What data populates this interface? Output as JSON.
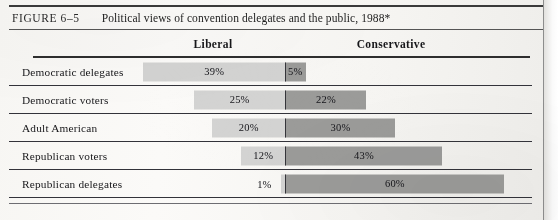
{
  "figure": {
    "label": "FIGURE 6–5",
    "title": "Political views of convention delegates and the public, 1988*"
  },
  "columns": {
    "left_header": "Liberal",
    "right_header": "Conservative"
  },
  "colors": {
    "liberal_bar": "#d3d3d2",
    "conservative_bar": "#9b9b99",
    "rule": "#33333a",
    "text": "#17171a",
    "page_background": "#f7f6f3"
  },
  "chart_data": {
    "type": "bar",
    "orientation": "horizontal-diverging",
    "title": "Political views of convention delegates and the public, 1988*",
    "xlabel": "",
    "ylabel": "",
    "categories": [
      "Democratic delegates",
      "Democratic voters",
      "Adult American",
      "Republican voters",
      "Republican delegates"
    ],
    "series": [
      {
        "name": "Liberal",
        "direction": "left",
        "color": "#d3d3d2",
        "values": [
          39,
          25,
          20,
          12,
          1
        ],
        "labels": [
          "39%",
          "25%",
          "20%",
          "12%",
          "1%"
        ]
      },
      {
        "name": "Conservative",
        "direction": "right",
        "color": "#9b9b99",
        "values": [
          5,
          22,
          30,
          43,
          60
        ],
        "labels": [
          "5%",
          "22%",
          "30%",
          "43%",
          "60%"
        ]
      }
    ],
    "units": "percent",
    "axis_center": 0,
    "grid": false,
    "legend": "column-headers"
  },
  "rows": [
    {
      "label": "Democratic delegates",
      "left": {
        "value": 39,
        "text": "39%"
      },
      "right": {
        "value": 5,
        "text": "5%"
      }
    },
    {
      "label": "Democratic voters",
      "left": {
        "value": 25,
        "text": "25%"
      },
      "right": {
        "value": 22,
        "text": "22%"
      }
    },
    {
      "label": "Adult American",
      "left": {
        "value": 20,
        "text": "20%"
      },
      "right": {
        "value": 30,
        "text": "30%"
      }
    },
    {
      "label": "Republican voters",
      "left": {
        "value": 12,
        "text": "12%"
      },
      "right": {
        "value": 43,
        "text": "43%"
      }
    },
    {
      "label": "Republican delegates",
      "left": {
        "value": 1,
        "text": "1%"
      },
      "right": {
        "value": 60,
        "text": "60%"
      }
    }
  ]
}
